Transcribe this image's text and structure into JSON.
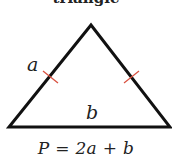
{
  "heading": {
    "text": "triangle",
    "clipped": true
  },
  "figure": {
    "shape": "isosceles-triangle",
    "vertices": {
      "apex": [
        91,
        25
      ],
      "bottom_left": [
        9,
        127
      ],
      "bottom_right": [
        170,
        127
      ]
    },
    "stroke_color": "#111111",
    "tick_color": "#d9503f",
    "labels": {
      "equal_side": "a",
      "base": "b"
    },
    "tick_marks": [
      {
        "side": "left",
        "center": [
          50,
          78
        ]
      },
      {
        "side": "right",
        "center": [
          131,
          78
        ]
      }
    ]
  },
  "formula": {
    "text": "P = 2a + b"
  }
}
